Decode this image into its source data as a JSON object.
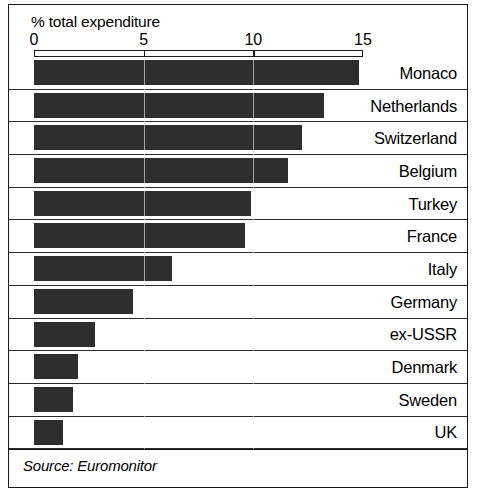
{
  "chart_data": {
    "type": "bar",
    "orientation": "horizontal",
    "title": "% total expenditure",
    "xlabel": "% total expenditure",
    "ylabel": "",
    "xlim": [
      0,
      15
    ],
    "ticks": [
      0,
      5,
      10,
      15
    ],
    "tick_labels": [
      "0",
      "5",
      "10",
      "15"
    ],
    "grid": true,
    "legend": null,
    "source": "Source: Euromonitor",
    "categories": [
      "Monaco",
      "Netherlands",
      "Switzerland",
      "Belgium",
      "Turkey",
      "France",
      "Italy",
      "Germany",
      "ex-USSR",
      "Denmark",
      "Sweden",
      "UK"
    ],
    "values": [
      14.8,
      13.2,
      12.2,
      11.6,
      9.9,
      9.6,
      6.3,
      4.5,
      2.8,
      2.0,
      1.8,
      1.3
    ],
    "bar_color": "#2e2e2e"
  },
  "axis": {
    "title": "% total expenditure",
    "ticks": [
      {
        "label": "0",
        "value": 0
      },
      {
        "label": "5",
        "value": 5
      },
      {
        "label": "10",
        "value": 10
      },
      {
        "label": "15",
        "value": 15
      }
    ]
  },
  "footer": {
    "source": "Source: Euromonitor"
  }
}
